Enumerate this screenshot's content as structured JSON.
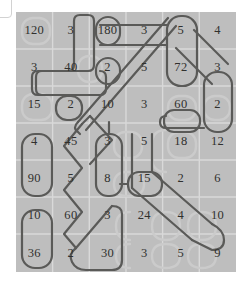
{
  "board": {
    "rows": 6,
    "cols": 6,
    "cell_width": 36.6,
    "cell_height": 43.3,
    "background_color": "#bebebe",
    "gridline_color": "#d9d9d9",
    "text_color": "#30302e",
    "path_stroke_color": "#5a5a58",
    "pill_stroke_color": "#6e6e6c",
    "watermark_color": "#c9c9c9",
    "grid_values": [
      [
        "120",
        "3",
        "180",
        "3",
        "5",
        "4"
      ],
      [
        "3",
        "40",
        "2",
        "5",
        "72",
        "3"
      ],
      [
        "15",
        "2",
        "10",
        "3",
        "60",
        "2"
      ],
      [
        "4",
        "45",
        "3",
        "5",
        "18",
        "12"
      ],
      [
        "90",
        "5",
        "8",
        "15",
        "2",
        "6"
      ],
      [
        "10",
        "60",
        "3",
        "24",
        "4",
        "10"
      ],
      [
        "36",
        "2",
        "30",
        "3",
        "5",
        "9"
      ]
    ],
    "grid_values_flat": [
      "120",
      "3",
      "180",
      "3",
      "5",
      "4",
      "3",
      "40",
      "2",
      "5",
      "72",
      "3",
      "15",
      "2",
      "10",
      "3",
      "60",
      "2",
      "4",
      "45",
      "3",
      "5",
      "18",
      "12",
      "90",
      "5",
      "8",
      "15",
      "2",
      "6",
      "10",
      "60",
      "3",
      "24",
      "4",
      "10",
      "36",
      "2",
      "30",
      "3",
      "5",
      "9"
    ]
  },
  "cells": [
    {
      "r": 0,
      "c": 0,
      "value": "120"
    },
    {
      "r": 0,
      "c": 1,
      "value": "3"
    },
    {
      "r": 0,
      "c": 2,
      "value": "180"
    },
    {
      "r": 0,
      "c": 3,
      "value": "3"
    },
    {
      "r": 0,
      "c": 4,
      "value": "5"
    },
    {
      "r": 0,
      "c": 5,
      "value": "4"
    },
    {
      "r": 1,
      "c": 0,
      "value": "3"
    },
    {
      "r": 1,
      "c": 1,
      "value": "40"
    },
    {
      "r": 1,
      "c": 2,
      "value": "2"
    },
    {
      "r": 1,
      "c": 3,
      "value": "5"
    },
    {
      "r": 1,
      "c": 4,
      "value": "72"
    },
    {
      "r": 1,
      "c": 5,
      "value": "3"
    },
    {
      "r": 2,
      "c": 0,
      "value": "15"
    },
    {
      "r": 2,
      "c": 1,
      "value": "2"
    },
    {
      "r": 2,
      "c": 2,
      "value": "10"
    },
    {
      "r": 2,
      "c": 3,
      "value": "3"
    },
    {
      "r": 2,
      "c": 4,
      "value": "60"
    },
    {
      "r": 2,
      "c": 5,
      "value": "2"
    },
    {
      "r": 3,
      "c": 0,
      "value": "4"
    },
    {
      "r": 3,
      "c": 1,
      "value": "45"
    },
    {
      "r": 3,
      "c": 2,
      "value": "3"
    },
    {
      "r": 3,
      "c": 3,
      "value": "5"
    },
    {
      "r": 3,
      "c": 4,
      "value": "18"
    },
    {
      "r": 3,
      "c": 5,
      "value": "12"
    },
    {
      "r": 4,
      "c": 0,
      "value": "90"
    },
    {
      "r": 4,
      "c": 1,
      "value": "5"
    },
    {
      "r": 4,
      "c": 2,
      "value": "8"
    },
    {
      "r": 4,
      "c": 3,
      "value": "15"
    },
    {
      "r": 4,
      "c": 4,
      "value": "2"
    },
    {
      "r": 4,
      "c": 5,
      "value": "6"
    },
    {
      "r": 5,
      "c": 0,
      "value": "10"
    },
    {
      "r": 5,
      "c": 1,
      "value": "60"
    },
    {
      "r": 5,
      "c": 2,
      "value": "3"
    },
    {
      "r": 5,
      "c": 3,
      "value": "24"
    },
    {
      "r": 5,
      "c": 4,
      "value": "4"
    },
    {
      "r": 5,
      "c": 5,
      "value": "10"
    },
    {
      "r": 6,
      "c": 0,
      "value": "36"
    },
    {
      "r": 6,
      "c": 1,
      "value": "2"
    },
    {
      "r": 6,
      "c": 2,
      "value": "30"
    },
    {
      "r": 6,
      "c": 3,
      "value": "3"
    },
    {
      "r": 6,
      "c": 4,
      "value": "5"
    },
    {
      "r": 6,
      "c": 5,
      "value": "9"
    }
  ]
}
